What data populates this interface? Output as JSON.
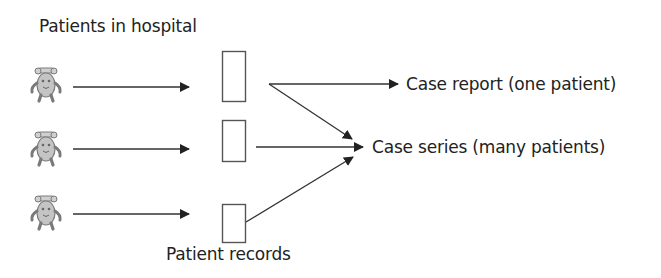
{
  "diagram": {
    "title": "Patients in hospital",
    "records_label": "Patient records",
    "outputs": [
      {
        "label": "Case report (one patient)"
      },
      {
        "label": "Case series (many patients)"
      }
    ],
    "patients": [
      {
        "icon": "patient-bear-icon",
        "row": 1
      },
      {
        "icon": "patient-bear-icon",
        "row": 2
      },
      {
        "icon": "patient-bear-icon",
        "row": 3
      }
    ],
    "records": [
      {
        "icon": "record-box",
        "row": 1
      },
      {
        "icon": "record-box",
        "row": 2
      },
      {
        "icon": "record-box",
        "row": 3
      }
    ],
    "colors": {
      "line": "#333333",
      "box_stroke": "#555555",
      "icon_fill": "#bdbdbd",
      "icon_stroke": "#7a7a7a",
      "text": "#222222"
    }
  }
}
